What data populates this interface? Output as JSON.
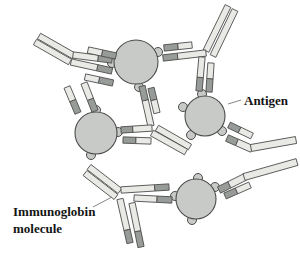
{
  "figure": {
    "labels": {
      "antigen": {
        "text": "Antigen"
      },
      "immunoglobin": {
        "line1": "Immunoglobin",
        "line2": "molecule"
      }
    },
    "colors": {
      "background": "#ffffff",
      "antigen_fill": "#c7cac6",
      "chain_light": "#e9eae6",
      "chain_dark": "#989c98",
      "outline": "#4c4c4c",
      "leader_line": "#777777",
      "label_text": "#141414"
    },
    "diagram": {
      "bump_radius": 4.5,
      "bar_width": 6.3,
      "antigens": [
        {
          "c": [
            136,
            62
          ],
          "r": 22,
          "bumps": [
            [
              112,
              63
            ],
            [
              139,
              87
            ],
            [
              158,
              52
            ]
          ]
        },
        {
          "c": [
            205,
            116
          ],
          "r": 20,
          "bumps": [
            [
              202,
              94
            ],
            [
              183,
              107
            ],
            [
              191,
              135
            ],
            [
              222,
              131
            ]
          ]
        },
        {
          "c": [
            96,
            133
          ],
          "r": 21,
          "bumps": [
            [
              96,
              110
            ],
            [
              118,
              132
            ],
            [
              91,
              155
            ]
          ]
        },
        {
          "c": [
            196,
            199
          ],
          "r": 20,
          "bumps": [
            [
              175,
              196
            ],
            [
              198,
              178
            ],
            [
              215,
              187
            ],
            [
              192,
              220
            ]
          ]
        }
      ],
      "bars": [
        {
          "p": [
            74,
            56,
            39,
            36
          ],
          "s": [
            [
              1,
              "light"
            ]
          ]
        },
        {
          "p": [
            70,
            62,
            35,
            42
          ],
          "s": [
            [
              1,
              "light"
            ]
          ]
        },
        {
          "p": [
            112,
            60,
            73,
            55
          ],
          "s": [
            [
              0.36,
              "dark"
            ],
            [
              0.64,
              "light"
            ]
          ]
        },
        {
          "p": [
            116,
            56,
            88,
            50
          ],
          "s": [
            [
              0.5,
              "dark"
            ],
            [
              0.5,
              "light"
            ]
          ]
        },
        {
          "p": [
            112,
            71,
            71,
            62
          ],
          "s": [
            [
              0.36,
              "dark"
            ],
            [
              0.64,
              "light"
            ]
          ]
        },
        {
          "p": [
            113,
            83,
            85,
            77
          ],
          "s": [
            [
              0.5,
              "dark"
            ],
            [
              0.5,
              "light"
            ]
          ]
        },
        {
          "p": [
            206,
            51,
            228,
            6
          ],
          "s": [
            [
              1,
              "light"
            ]
          ]
        },
        {
          "p": [
            213,
            56,
            235,
            10
          ],
          "s": [
            [
              1,
              "light"
            ]
          ]
        },
        {
          "p": [
            163,
            58,
            206,
            53
          ],
          "s": [
            [
              0.34,
              "dark"
            ],
            [
              0.66,
              "light"
            ]
          ]
        },
        {
          "p": [
            164,
            48,
            192,
            45
          ],
          "s": [
            [
              0.5,
              "dark"
            ],
            [
              0.5,
              "light"
            ]
          ]
        },
        {
          "p": [
            199,
            91,
            202,
            57
          ],
          "s": [
            [
              0.4,
              "dark"
            ],
            [
              0.6,
              "light"
            ]
          ]
        },
        {
          "p": [
            209,
            92,
            211,
            63
          ],
          "s": [
            [
              0.46,
              "dark"
            ],
            [
              0.54,
              "light"
            ]
          ]
        },
        {
          "p": [
            157,
            128,
            190,
            147
          ],
          "s": [
            [
              1,
              "light"
            ]
          ]
        },
        {
          "p": [
            152,
            133,
            186,
            152
          ],
          "s": [
            [
              1,
              "light"
            ]
          ]
        },
        {
          "p": [
            142,
            86,
            151,
            126
          ],
          "s": [
            [
              0.36,
              "dark"
            ],
            [
              0.64,
              "light"
            ]
          ]
        },
        {
          "p": [
            151,
            88,
            157,
            113
          ],
          "s": [
            [
              0.48,
              "dark"
            ],
            [
              0.52,
              "light"
            ]
          ]
        },
        {
          "p": [
            121,
            130,
            152,
            128
          ],
          "s": [
            [
              0.38,
              "dark"
            ],
            [
              0.62,
              "light"
            ]
          ]
        },
        {
          "p": [
            123,
            140,
            151,
            141
          ],
          "s": [
            [
              0.46,
              "dark"
            ],
            [
              0.54,
              "light"
            ]
          ]
        },
        {
          "p": [
            227,
            138,
            252,
            149
          ],
          "w": 7,
          "s": [
            [
              0.4,
              "dark"
            ],
            [
              0.6,
              "light"
            ]
          ]
        },
        {
          "p": [
            251,
            148,
            296,
            140
          ],
          "w": 7,
          "s": [
            [
              1,
              "light"
            ]
          ]
        },
        {
          "p": [
            229,
            125,
            252,
            136
          ],
          "s": [
            [
              0.46,
              "dark"
            ],
            [
              0.54,
              "light"
            ]
          ]
        },
        {
          "p": [
            219,
            190,
            245,
            177
          ],
          "w": 7,
          "s": [
            [
              0.4,
              "dark"
            ],
            [
              0.6,
              "light"
            ]
          ]
        },
        {
          "p": [
            244,
            177,
            297,
            162
          ],
          "w": 7,
          "s": [
            [
              1,
              "light"
            ]
          ]
        },
        {
          "p": [
            225,
            196,
            250,
            185
          ],
          "s": [
            [
              0.46,
              "dark"
            ],
            [
              0.54,
              "light"
            ]
          ]
        },
        {
          "p": [
            120,
            191,
            89,
            167
          ],
          "s": [
            [
              1,
              "light"
            ]
          ]
        },
        {
          "p": [
            116,
            197,
            85,
            173
          ],
          "s": [
            [
              1,
              "light"
            ]
          ]
        },
        {
          "p": [
            169,
            187,
            121,
            190
          ],
          "s": [
            [
              0.3,
              "dark"
            ],
            [
              0.7,
              "light"
            ]
          ]
        },
        {
          "p": [
            172,
            200,
            134,
            198
          ],
          "s": [
            [
              0.4,
              "dark"
            ],
            [
              0.6,
              "light"
            ]
          ]
        },
        {
          "p": [
            130,
            243,
            120,
            199
          ],
          "s": [
            [
              0.3,
              "dark"
            ],
            [
              0.7,
              "light"
            ]
          ]
        },
        {
          "p": [
            141,
            247,
            132,
            203
          ],
          "s": [
            [
              0.36,
              "dark"
            ],
            [
              0.64,
              "light"
            ]
          ]
        },
        {
          "p": [
            95,
            111,
            84,
            83
          ],
          "w": 6.5,
          "s": [
            [
              0.42,
              "dark"
            ],
            [
              0.58,
              "light"
            ]
          ]
        },
        {
          "p": [
            78,
            113,
            67,
            87
          ],
          "w": 6.5,
          "s": [
            [
              0.48,
              "dark"
            ],
            [
              0.52,
              "light"
            ]
          ]
        }
      ],
      "leaders": [
        {
          "p": [
            228,
            104,
            241,
            100
          ],
          "for": "antigen"
        },
        {
          "p": [
            93,
            207,
            112,
            197
          ],
          "for": "immunoglobin"
        }
      ]
    }
  }
}
